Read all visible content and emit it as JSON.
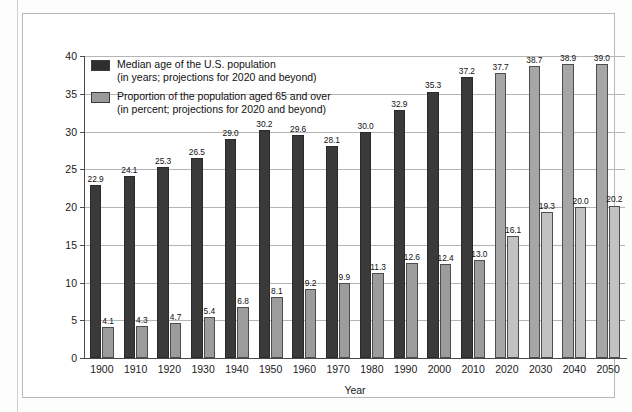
{
  "chart_data": {
    "type": "bar",
    "title": "",
    "xlabel": "Year",
    "ylabel": "",
    "ylim": [
      0,
      40
    ],
    "yticks": [
      0,
      5,
      10,
      15,
      20,
      25,
      30,
      35,
      40
    ],
    "grid": true,
    "legend_position": "top-left",
    "categories": [
      "1900",
      "1910",
      "1920",
      "1930",
      "1940",
      "1950",
      "1960",
      "1970",
      "1980",
      "1990",
      "2000",
      "2010",
      "2020",
      "2030",
      "2040",
      "2050"
    ],
    "projection_start_year": "2020",
    "series": [
      {
        "name": "Median age of the U.S. population",
        "unit": "years",
        "note": "(in years; projections for 2020 and beyond)",
        "color": "#3a3a3a",
        "projection_color": "#a6a6a6",
        "values": [
          22.9,
          24.1,
          25.3,
          26.5,
          29.0,
          30.2,
          29.6,
          28.1,
          30.0,
          32.9,
          35.3,
          37.2,
          37.7,
          38.7,
          38.9,
          39.0
        ]
      },
      {
        "name": "Proportion of the population aged 65 and over",
        "unit": "percent",
        "note": "(in percent; projections for 2020 and beyond)",
        "color": "#9c9c9c",
        "projection_color": "#c2c2c2",
        "values": [
          4.1,
          4.3,
          4.7,
          5.4,
          6.8,
          8.1,
          9.2,
          9.9,
          11.3,
          12.6,
          12.4,
          13.0,
          16.1,
          19.3,
          20.0,
          20.2
        ]
      }
    ]
  },
  "legend": {
    "items": [
      {
        "line1": "Median age of the U.S. population",
        "line2": "(in years; projections for 2020 and beyond)",
        "swatch": "dark"
      },
      {
        "line1": "Proportion of the population aged 65 and over",
        "line2": "(in percent; projections for 2020 and beyond)",
        "swatch": "gray"
      }
    ]
  }
}
